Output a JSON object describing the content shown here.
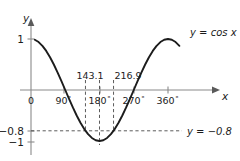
{
  "figure": {
    "axes": {
      "x_axis_label": "x",
      "y_axis_label": "y",
      "x_ticks": [
        "0",
        "90",
        "180",
        "270",
        "360"
      ],
      "x_tick_degree_symbol": "°",
      "x_tick_values": [
        0,
        90,
        180,
        270,
        360
      ],
      "y_ticks": [
        "1",
        "−0.8",
        "−1"
      ],
      "y_tick_values": [
        1,
        -0.8,
        -1
      ]
    },
    "curve_label": "y = cos x",
    "line_label": "y = −0.8",
    "intersection_labels": [
      "143.1",
      "216.9"
    ],
    "intersection_values": [
      143.1,
      216.9
    ],
    "colors": {
      "curve": "#1c1c1c",
      "axis": "#8a8a8a",
      "dashed": "#4a4a4a",
      "background": "#ffffff"
    }
  },
  "chart_data": {
    "type": "line",
    "title": "",
    "xlabel": "x",
    "ylabel": "y",
    "xlim": [
      0,
      360
    ],
    "ylim": [
      -1,
      1
    ],
    "grid": false,
    "legend": "inline-annotations",
    "xticks": [
      0,
      90,
      180,
      270,
      360
    ],
    "xticklabels": [
      "0",
      "90°",
      "180°",
      "270°",
      "360°"
    ],
    "yticks": [
      1,
      -0.8,
      -1
    ],
    "yticklabels": [
      "1",
      "−0.8",
      "−1"
    ],
    "series": [
      {
        "name": "y = cos x",
        "type": "line",
        "x": [
          10,
          20,
          30,
          40,
          50,
          60,
          70,
          80,
          90,
          100,
          110,
          120,
          130,
          140,
          150,
          160,
          170,
          180,
          190,
          200,
          210,
          220,
          230,
          240,
          250,
          260,
          270,
          280,
          290,
          300,
          310,
          320,
          330,
          340,
          350,
          360,
          370,
          380,
          390
        ],
        "y": [
          0.985,
          0.94,
          0.866,
          0.766,
          0.643,
          0.5,
          0.342,
          0.174,
          0.0,
          -0.174,
          -0.342,
          -0.5,
          -0.643,
          -0.766,
          -0.866,
          -0.94,
          -0.985,
          -1.0,
          -0.985,
          -0.94,
          -0.866,
          -0.766,
          -0.643,
          -0.5,
          -0.342,
          -0.174,
          0.0,
          0.174,
          0.342,
          0.5,
          0.643,
          0.766,
          0.866,
          0.94,
          0.985,
          1.0,
          0.985,
          0.94,
          0.866
        ]
      },
      {
        "name": "y = −0.8",
        "type": "hline",
        "y": -0.8,
        "style": "dashed"
      }
    ],
    "annotations": [
      {
        "label": "143.1",
        "x": 143.1,
        "y": -0.8,
        "kind": "intersection",
        "vline": "dashed"
      },
      {
        "label": "216.9",
        "x": 216.9,
        "y": -0.8,
        "kind": "intersection",
        "vline": "dashed"
      },
      {
        "label": "180°-center",
        "x": 180,
        "y": -1,
        "kind": "minimum",
        "vline": "dashed"
      }
    ]
  }
}
